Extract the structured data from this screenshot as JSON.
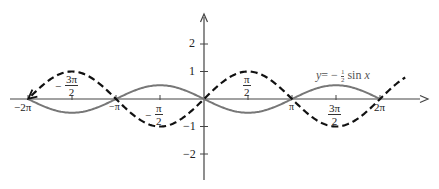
{
  "chart_data": {
    "type": "line",
    "title": "",
    "xlabel": "",
    "ylabel": "",
    "xlim": [
      -6.9,
      7.4
    ],
    "ylim": [
      -3.0,
      3.6
    ],
    "grid": false,
    "x_ticks": [
      {
        "value": "-2π",
        "label": "−2π"
      },
      {
        "value": "-3π/2",
        "label_sign": "−",
        "label_num": "3π",
        "label_den": "2"
      },
      {
        "value": "-π",
        "label": "−π"
      },
      {
        "value": "-π/2",
        "label_sign": "−",
        "label_num": "π",
        "label_den": "2"
      },
      {
        "value": "π/2",
        "label_num": "π",
        "label_den": "2"
      },
      {
        "value": "π",
        "label": "π"
      },
      {
        "value": "3π/2",
        "label_num": "3π",
        "label_den": "2"
      },
      {
        "value": "2π",
        "label": "2π"
      }
    ],
    "y_ticks": [
      {
        "value": 2,
        "label": "2"
      },
      {
        "value": 1,
        "label": "1"
      },
      {
        "value": -1,
        "label": "−1"
      },
      {
        "value": -2,
        "label": "−2"
      }
    ],
    "series": [
      {
        "name": "y = sin x",
        "style": "dashed",
        "color": "#111111",
        "function": "sin(x)",
        "x_range": [
          "-2π",
          "2π+0.9"
        ],
        "points": [
          [
            -6.283,
            0
          ],
          [
            -4.712,
            1
          ],
          [
            -3.142,
            0
          ],
          [
            -1.571,
            -1
          ],
          [
            0,
            0
          ],
          [
            1.571,
            1
          ],
          [
            3.142,
            0
          ],
          [
            4.712,
            -1
          ],
          [
            6.283,
            0
          ],
          [
            7.2,
            0.79
          ]
        ]
      },
      {
        "name": "y = −½ sin x",
        "style": "solid",
        "color": "#777777",
        "function": "-0.5*sin(x)",
        "x_range": [
          "-2π",
          "2π"
        ],
        "points": [
          [
            -6.283,
            0
          ],
          [
            -4.712,
            -0.5
          ],
          [
            -3.142,
            0
          ],
          [
            -1.571,
            0.5
          ],
          [
            0,
            0
          ],
          [
            1.571,
            -0.5
          ],
          [
            3.142,
            0
          ],
          [
            4.712,
            0.5
          ],
          [
            6.283,
            0
          ]
        ]
      }
    ],
    "annotations": [
      {
        "text": "y = −½ sin x",
        "near_series": "y = −½ sin x",
        "position": "above curve near x = 3π/2"
      }
    ],
    "legend": null
  },
  "labels": {
    "y_ticks": [
      "2",
      "1",
      "−1",
      "−2"
    ],
    "x_neg2pi": "−2π",
    "x_negpi": "−π",
    "x_pi": "π",
    "x_2pi": "2π",
    "x_neg3pi2": {
      "sign": "−",
      "num": "3π",
      "den": "2"
    },
    "x_negpi2": {
      "sign": "−",
      "num": "π",
      "den": "2"
    },
    "x_pi2": {
      "num": "π",
      "den": "2"
    },
    "x_3pi2": {
      "num": "3π",
      "den": "2"
    },
    "annotation": {
      "y": "y",
      "eq": "= −",
      "num": "1",
      "den": "2",
      "fn": "sin",
      "x": "x"
    }
  },
  "colors": {
    "axis": "#444444",
    "dashed_curve": "#111111",
    "solid_curve": "#777777"
  }
}
